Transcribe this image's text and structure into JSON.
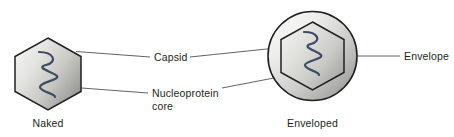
{
  "figure": {
    "type": "biology-diagram"
  },
  "labels": {
    "capsid": "Capsid",
    "nucleoprotein_line1": "Nucleoprotein",
    "nucleoprotein_line2": "core",
    "envelope": "Envelope"
  },
  "captions": {
    "naked": "Naked",
    "enveloped": "Enveloped"
  },
  "colors": {
    "background": "#ffffff",
    "outline": "#231f20",
    "leader": "#3a3a3c",
    "helix": "#3f4b63",
    "capsid_fill_light": "#f2f2f0",
    "capsid_fill_mid": "#d8d8d6",
    "capsid_fill_dark": "#8e8e8c",
    "envelope_fill_light": "#f4f4f3",
    "envelope_fill_dark": "#9a9a98",
    "text": "#231f20"
  }
}
